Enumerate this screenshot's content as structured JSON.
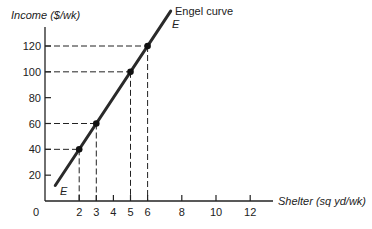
{
  "chart_data": {
    "type": "line",
    "title": "",
    "xlabel": "Shelter (sq yd/wk)",
    "ylabel": "Income ($/wk)",
    "xlim": [
      0,
      13.5
    ],
    "ylim": [
      0,
      135
    ],
    "x_ticks": [
      2,
      3,
      4,
      5,
      6,
      8,
      10,
      12
    ],
    "x_tick_labels": [
      "2",
      "3",
      "4",
      "5",
      "6",
      "8",
      "10",
      "12"
    ],
    "y_ticks": [
      20,
      40,
      60,
      80,
      100,
      120
    ],
    "y_tick_labels": [
      "20",
      "40",
      "60",
      "80",
      "100",
      "120"
    ],
    "origin_label": "0",
    "grid": false,
    "legend": null,
    "series": [
      {
        "name": "Engel curve",
        "label_start": "E",
        "label_end": "E",
        "x": [
          2,
          3,
          5,
          6
        ],
        "y": [
          40,
          60,
          100,
          120
        ],
        "marked_points": [
          {
            "x": 2,
            "y": 40
          },
          {
            "x": 3,
            "y": 60
          },
          {
            "x": 5,
            "y": 100
          },
          {
            "x": 6,
            "y": 120
          }
        ]
      }
    ],
    "annotations": [
      "Engel curve",
      "E",
      "E"
    ],
    "guide_lines": "dashed projections from each marked point to both axes"
  }
}
